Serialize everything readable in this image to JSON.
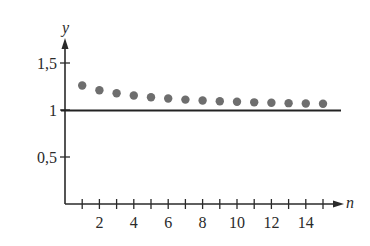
{
  "chart_data": {
    "type": "scatter",
    "title": "",
    "xlabel": "n",
    "ylabel": "y",
    "x": [
      1,
      2,
      3,
      4,
      5,
      6,
      7,
      8,
      9,
      10,
      11,
      12,
      13,
      14,
      15
    ],
    "series": [
      {
        "name": "sequence",
        "values": [
          1.25,
          1.2,
          1.167,
          1.143,
          1.125,
          1.111,
          1.1,
          1.091,
          1.083,
          1.077,
          1.071,
          1.067,
          1.062,
          1.059,
          1.056
        ],
        "color": "#6e6e6e"
      }
    ],
    "reference_lines": [
      {
        "type": "horizontal",
        "y": 1,
        "color": "#222222"
      }
    ],
    "x_ticks": [
      1,
      2,
      3,
      4,
      5,
      6,
      7,
      8,
      9,
      10,
      11,
      12,
      13,
      14,
      15
    ],
    "x_tick_labels": [
      "2",
      "4",
      "6",
      "8",
      "10",
      "12",
      "14"
    ],
    "x_tick_label_values": [
      2,
      4,
      6,
      8,
      10,
      12,
      14
    ],
    "y_ticks": [
      0.5,
      1,
      1.5
    ],
    "y_tick_labels": [
      "0,5",
      "1",
      "1,5"
    ],
    "xlim": [
      0,
      16
    ],
    "ylim": [
      0,
      1.7
    ],
    "grid": false,
    "legend": "none"
  }
}
